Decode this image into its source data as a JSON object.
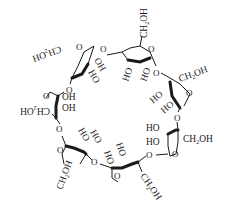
{
  "diagram": {
    "units": [
      {
        "id": 1,
        "ch2oh": "CH2OH",
        "hydroxyls": [
          "OH",
          "HO"
        ]
      },
      {
        "id": 2,
        "ch2oh": "CH2OH",
        "hydroxyls": [
          "HO",
          "HO"
        ]
      },
      {
        "id": 3,
        "ch2oh": "CH2OH",
        "hydroxyls": [
          "HO",
          "HO"
        ]
      },
      {
        "id": 4,
        "ch2oh": "CH2OH",
        "hydroxyls": [
          "HO",
          "HO"
        ]
      },
      {
        "id": 5,
        "ch2oh": "CH2OH",
        "hydroxyls": [
          "HO",
          "HO"
        ]
      },
      {
        "id": 6,
        "ch2oh": "CH2OH",
        "hydroxyls": [
          "HO",
          "HO"
        ]
      },
      {
        "id": 7,
        "ch2oh": "CH2OH",
        "hydroxyls": [
          "OH",
          "OH"
        ]
      }
    ],
    "labels": {
      "ch": "CH",
      "two": "2",
      "oh": "OH",
      "ho": "HO",
      "ring_o": "O",
      "bridge_o": "O"
    }
  }
}
